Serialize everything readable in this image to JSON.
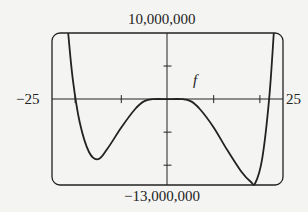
{
  "chart_data": {
    "type": "line",
    "title": "",
    "xlabel": "",
    "ylabel": "",
    "xlim": [
      -25,
      25
    ],
    "ylim": [
      -13000000,
      10000000
    ],
    "x_tick_labels": {
      "left": "−25",
      "right": "25"
    },
    "y_tick_labels": {
      "top": "10,000,000",
      "bottom": "−13,000,000"
    },
    "x_ticks": [
      -20,
      -10,
      10,
      20
    ],
    "y_ticks": [
      5000000,
      -5000000,
      -10000000
    ],
    "grid": false,
    "series": [
      {
        "name": "f",
        "label": "f",
        "x": [
          -21.5,
          -20.5,
          -19,
          -17,
          -15,
          -13,
          -10,
          -7,
          -5,
          -3,
          0,
          3,
          5,
          7,
          10,
          13,
          16,
          18,
          19,
          20.5,
          22,
          23
        ],
        "y": [
          10000000,
          3000000,
          -3500000,
          -8000000,
          -9100000,
          -7500000,
          -4300000,
          -1500000,
          -300000,
          0,
          0,
          0,
          -300000,
          -1500000,
          -4300000,
          -7800000,
          -11000000,
          -12500000,
          -12700000,
          -9000000,
          0,
          10000000
        ]
      }
    ],
    "annotations": [
      {
        "text": "f",
        "x": 3,
        "y": 1200000
      }
    ]
  }
}
